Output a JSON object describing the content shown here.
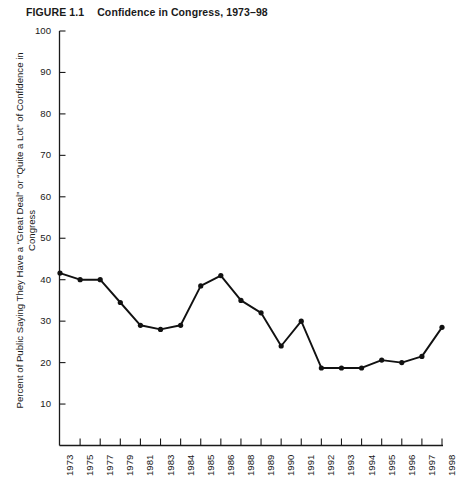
{
  "figure": {
    "label": "FIGURE 1.1",
    "title": "Confidence in Congress, 1973–98"
  },
  "chart_data": {
    "type": "line",
    "title": "Confidence in Congress, 1973–98",
    "xlabel": "",
    "ylabel": "Percent of Public Saying They Have a “Great Deal” or “Quite a Lot” of Confidence in Congress",
    "categories": [
      "1973",
      "1975",
      "1977",
      "1979",
      "1981",
      "1983",
      "1984",
      "1985",
      "1986",
      "1988",
      "1989",
      "1990",
      "1991",
      "1992",
      "1993",
      "1994",
      "1995",
      "1996",
      "1997",
      "1998"
    ],
    "values": [
      41.6,
      40.0,
      40.0,
      34.5,
      29.0,
      28.0,
      29.0,
      38.5,
      41.0,
      35.0,
      32.0,
      24.0,
      30.0,
      18.7,
      18.7,
      18.7,
      20.6,
      20.0,
      21.5,
      28.5
    ],
    "ylim": [
      0,
      100
    ],
    "yticks": [
      10,
      20,
      30,
      40,
      50,
      60,
      70,
      80,
      90,
      100
    ],
    "ytick_labels": [
      "10",
      "20",
      "30",
      "40",
      "50",
      "60",
      "70",
      "80",
      "90",
      "100"
    ],
    "grid": false,
    "legend": "none",
    "marker": "filled-circle",
    "line_color": "#111111"
  }
}
